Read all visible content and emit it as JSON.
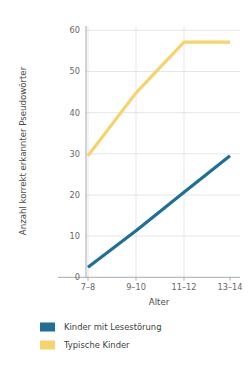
{
  "chart_data": {
    "type": "line",
    "title": "",
    "subtitle": "",
    "xlabel": "Alter",
    "ylabel": "Anzahl korrekt erkannter Pseudowörter",
    "categories": [
      "7–8",
      "9–10",
      "11–12",
      "13–14"
    ],
    "series": [
      {
        "name": "Kinder mit Lesestörung",
        "color": "#1f6f97",
        "values": [
          2.5,
          11.5,
          21,
          30
        ]
      },
      {
        "name": "Typische Kinder",
        "color": "#f7d36b",
        "values": [
          30,
          45.5,
          58,
          58
        ]
      }
    ],
    "ylim": [
      0,
      62
    ],
    "yticks": [
      0,
      10,
      20,
      30,
      40,
      50,
      60
    ],
    "ytick_labels": [
      "0",
      "10",
      "20",
      "30",
      "40",
      "50",
      "60"
    ],
    "xtick_labels": [
      "7–8",
      "9–10",
      "11–12",
      "13–14"
    ],
    "grid": "horizontal-and-vertical",
    "legend_position": "bottom-left"
  },
  "axes": {
    "y_title": "Anzahl korrekt erkannter Pseudowörter",
    "x_title": "Alter",
    "y_ticks": {
      "t0": "0",
      "t1": "10",
      "t2": "20",
      "t3": "30",
      "t4": "40",
      "t5": "50",
      "t6": "60"
    },
    "x_ticks": {
      "t0": "7–8",
      "t1": "9–10",
      "t2": "11–12",
      "t3": "13–14"
    }
  },
  "legend": {
    "entries": [
      {
        "label": "Kinder mit Lesestörung",
        "color": "#1f6f97"
      },
      {
        "label": "Typische Kinder",
        "color": "#f7d36b"
      }
    ],
    "item_0_label": "Kinder mit Lesestörung",
    "item_1_label": "Typische Kinder"
  },
  "colors": {
    "background": "#ffffff",
    "grid": "#d9dde2",
    "axis": "#9aa0a6",
    "series_blue": "#1f6f97",
    "series_yellow": "#f7d36b",
    "text": "#4d4d4d"
  }
}
